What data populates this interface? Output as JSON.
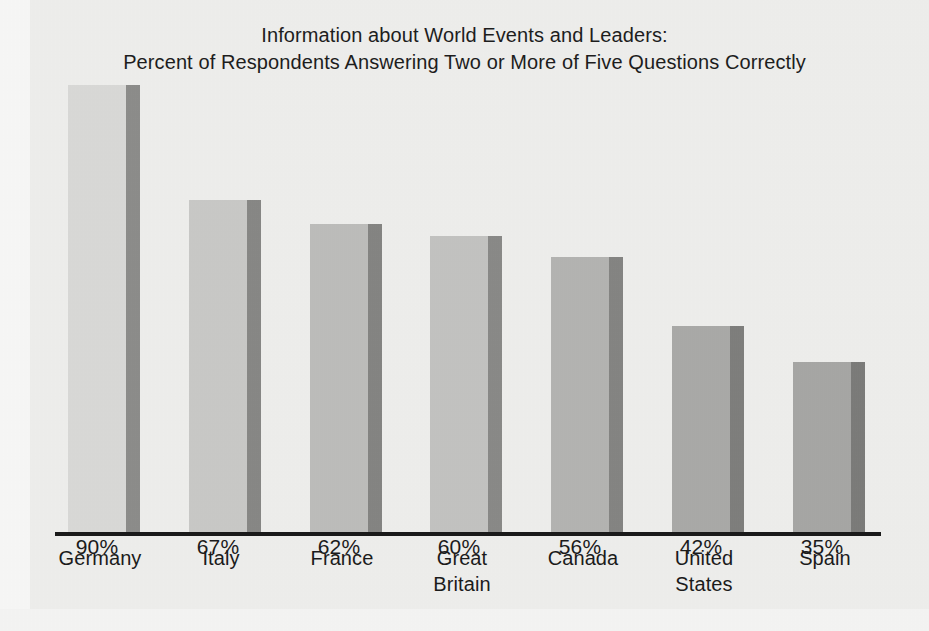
{
  "chart_data": {
    "type": "bar",
    "title": "Information about World Events and Leaders: Percent of Respondents Answering Two or More of Five Questions Correctly",
    "title_lines": [
      "Information about World Events and Leaders:",
      "Percent of Respondents Answering Two or More of Five Questions Correctly"
    ],
    "xlabel": "",
    "ylabel": "",
    "ylim": [
      0,
      100
    ],
    "grid": false,
    "legend": null,
    "categories": [
      "Germany",
      "Italy",
      "France",
      "Great Britain",
      "Canada",
      "United States",
      "Spain"
    ],
    "values": [
      90,
      67,
      62,
      60,
      56,
      42,
      35
    ],
    "value_labels": [
      "90%",
      "67%",
      "62%",
      "60%",
      "56%",
      "42%",
      "35%"
    ],
    "bars": [
      {
        "category": "Germany",
        "label_line1": "Germany",
        "label_line2": "",
        "value": 90,
        "value_label": "90%",
        "x": 68,
        "label_x": 64,
        "top": 85,
        "height": 449,
        "body_color": "#d9d9d7",
        "side_color": "#8d8d8b"
      },
      {
        "category": "Italy",
        "label_line1": "Italy",
        "label_line2": "",
        "value": 67,
        "value_label": "67%",
        "x": 189,
        "label_x": 185,
        "top": 200,
        "height": 334,
        "body_color": "#c9c9c7",
        "side_color": "#888886"
      },
      {
        "category": "France",
        "label_line1": "France",
        "label_line2": "",
        "value": 62,
        "value_label": "62%",
        "x": 310,
        "label_x": 306,
        "top": 224,
        "height": 310,
        "body_color": "#bdbdbb",
        "side_color": "#858583"
      },
      {
        "category": "Great Britain",
        "label_line1": "Great",
        "label_line2": "Britain",
        "value": 60,
        "value_label": "60%",
        "x": 430,
        "label_x": 426,
        "top": 236,
        "height": 298,
        "body_color": "#c3c3c1",
        "side_color": "#8a8a88"
      },
      {
        "category": "Canada",
        "label_line1": "Canada",
        "label_line2": "",
        "value": 56,
        "value_label": "56%",
        "x": 551,
        "label_x": 547,
        "top": 257,
        "height": 277,
        "body_color": "#b4b4b2",
        "side_color": "#858583"
      },
      {
        "category": "United States",
        "label_line1": "United",
        "label_line2": "States",
        "value": 42,
        "value_label": "42%",
        "x": 672,
        "label_x": 668,
        "top": 326,
        "height": 208,
        "body_color": "#aaaaa8",
        "side_color": "#7f7f7d"
      },
      {
        "category": "Spain",
        "label_line1": "Spain",
        "label_line2": "",
        "value": 35,
        "value_label": "35%",
        "x": 793,
        "label_x": 789,
        "top": 362,
        "height": 172,
        "body_color": "#a7a7a5",
        "side_color": "#7c7c7a"
      }
    ],
    "axis": {
      "baseline_color": "#1a1a1a",
      "baseline_y": 534
    },
    "colors": {
      "background": "#eeeeec",
      "text": "#1b1b1b"
    }
  }
}
